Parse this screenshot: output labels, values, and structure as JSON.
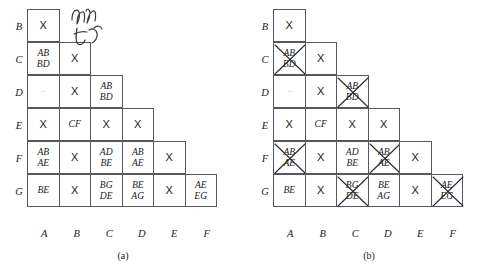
{
  "figure": {
    "row_labels": [
      "B",
      "C",
      "D",
      "E",
      "F",
      "G"
    ],
    "col_labels": [
      "A",
      "B",
      "C",
      "D",
      "E",
      "F"
    ],
    "panels": [
      {
        "caption": "(a)",
        "rows": [
          {
            "label": "B",
            "cells": [
              {
                "lines": [
                  "X"
                ],
                "kind": "x",
                "struck": false
              }
            ]
          },
          {
            "label": "C",
            "cells": [
              {
                "lines": [
                  "AB",
                  "BD"
                ],
                "kind": "pair",
                "struck": false
              },
              {
                "lines": [
                  "X"
                ],
                "kind": "x",
                "struck": false
              }
            ]
          },
          {
            "label": "D",
            "cells": [
              {
                "lines": [
                  "–"
                ],
                "kind": "blank",
                "struck": false
              },
              {
                "lines": [
                  "X"
                ],
                "kind": "x",
                "struck": false
              },
              {
                "lines": [
                  "AB",
                  "BD"
                ],
                "kind": "pair",
                "struck": false
              }
            ]
          },
          {
            "label": "E",
            "cells": [
              {
                "lines": [
                  "X"
                ],
                "kind": "x",
                "struck": false
              },
              {
                "lines": [
                  "CF"
                ],
                "kind": "pair",
                "struck": false
              },
              {
                "lines": [
                  "X"
                ],
                "kind": "x",
                "struck": false
              },
              {
                "lines": [
                  "X"
                ],
                "kind": "x",
                "struck": false
              }
            ]
          },
          {
            "label": "F",
            "cells": [
              {
                "lines": [
                  "AB",
                  "AE"
                ],
                "kind": "pair",
                "struck": false
              },
              {
                "lines": [
                  "X"
                ],
                "kind": "x",
                "struck": false
              },
              {
                "lines": [
                  "AD",
                  "BE"
                ],
                "kind": "pair",
                "struck": false
              },
              {
                "lines": [
                  "AB",
                  "AE"
                ],
                "kind": "pair",
                "struck": false
              },
              {
                "lines": [
                  "X"
                ],
                "kind": "x",
                "struck": false
              }
            ]
          },
          {
            "label": "G",
            "cells": [
              {
                "lines": [
                  "BE"
                ],
                "kind": "pair",
                "struck": false
              },
              {
                "lines": [
                  "X"
                ],
                "kind": "x",
                "struck": false
              },
              {
                "lines": [
                  "BG",
                  "DE"
                ],
                "kind": "pair",
                "struck": false
              },
              {
                "lines": [
                  "BE",
                  "AG"
                ],
                "kind": "pair",
                "struck": false
              },
              {
                "lines": [
                  "X"
                ],
                "kind": "x",
                "struck": false
              },
              {
                "lines": [
                  "AE",
                  "EG"
                ],
                "kind": "pair",
                "struck": false
              }
            ]
          }
        ]
      },
      {
        "caption": "(b)",
        "rows": [
          {
            "label": "B",
            "cells": [
              {
                "lines": [
                  "X"
                ],
                "kind": "x",
                "struck": false
              }
            ]
          },
          {
            "label": "C",
            "cells": [
              {
                "lines": [
                  "AB",
                  "BD"
                ],
                "kind": "pair",
                "struck": true
              },
              {
                "lines": [
                  "X"
                ],
                "kind": "x",
                "struck": false
              }
            ]
          },
          {
            "label": "D",
            "cells": [
              {
                "lines": [
                  "–"
                ],
                "kind": "blank",
                "struck": false
              },
              {
                "lines": [
                  "X"
                ],
                "kind": "x",
                "struck": false
              },
              {
                "lines": [
                  "AB",
                  "BD"
                ],
                "kind": "pair",
                "struck": true
              }
            ]
          },
          {
            "label": "E",
            "cells": [
              {
                "lines": [
                  "X"
                ],
                "kind": "x",
                "struck": false
              },
              {
                "lines": [
                  "CF"
                ],
                "kind": "pair",
                "struck": false
              },
              {
                "lines": [
                  "X"
                ],
                "kind": "x",
                "struck": false
              },
              {
                "lines": [
                  "X"
                ],
                "kind": "x",
                "struck": false
              }
            ]
          },
          {
            "label": "F",
            "cells": [
              {
                "lines": [
                  "AB",
                  "AE"
                ],
                "kind": "pair",
                "struck": true
              },
              {
                "lines": [
                  "X"
                ],
                "kind": "x",
                "struck": false
              },
              {
                "lines": [
                  "AD",
                  "BE"
                ],
                "kind": "pair",
                "struck": false
              },
              {
                "lines": [
                  "AB",
                  "AE"
                ],
                "kind": "pair",
                "struck": true
              },
              {
                "lines": [
                  "X"
                ],
                "kind": "x",
                "struck": false
              }
            ]
          },
          {
            "label": "G",
            "cells": [
              {
                "lines": [
                  "BE"
                ],
                "kind": "pair",
                "struck": false
              },
              {
                "lines": [
                  "X"
                ],
                "kind": "x",
                "struck": false
              },
              {
                "lines": [
                  "BG",
                  "DE"
                ],
                "kind": "pair",
                "struck": true
              },
              {
                "lines": [
                  "BE",
                  "AG"
                ],
                "kind": "pair",
                "struck": false
              },
              {
                "lines": [
                  "X"
                ],
                "kind": "x",
                "struck": false
              },
              {
                "lines": [
                  "AE",
                  "EG"
                ],
                "kind": "pair",
                "struck": true
              }
            ]
          }
        ]
      }
    ]
  }
}
